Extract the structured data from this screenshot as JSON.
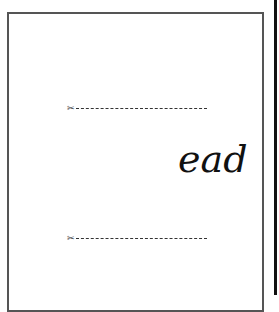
{
  "card": {
    "word": "ead",
    "cut_lines": [
      {
        "icon": "scissors-icon",
        "glyph": "✂"
      },
      {
        "icon": "scissors-icon",
        "glyph": "✂"
      }
    ]
  }
}
